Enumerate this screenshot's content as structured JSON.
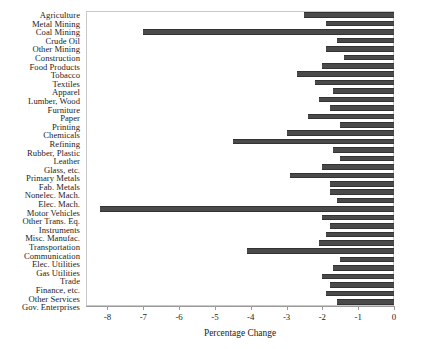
{
  "chart_data": {
    "type": "bar",
    "orientation": "horizontal",
    "title": "",
    "xlabel": "Percentage Change",
    "ylabel": "",
    "xlim": [
      -8.6,
      0
    ],
    "ylim": null,
    "grid": false,
    "legend": null,
    "bar_color": "#4a4a4a",
    "frame_color": "#c9c9c9",
    "axis_ticks": [
      "-8",
      "-7",
      "-6",
      "-5",
      "-4",
      "-3",
      "-2",
      "-1",
      "0"
    ],
    "axis_tick_values": [
      -8,
      -7,
      -6,
      -5,
      -4,
      -3,
      -2,
      -1,
      0
    ],
    "categories": [
      "Agriculture",
      "Metal Mining",
      "Coal Mining",
      "Crude Oil",
      "Other Mining",
      "Construction",
      "Food Products",
      "Tobacco",
      "Textiles",
      "Apparel",
      "Lumber, Wood",
      "Furniture",
      "Paper",
      "Printing",
      "Chemicals",
      "Refining",
      "Rubber, Plastic",
      "Leather",
      "Glass, etc.",
      "Primary Metals",
      "Fab. Metals",
      "Nonelec. Mach.",
      "Elec. Mach.",
      "Motor Vehicles",
      "Other Trans. Eq.",
      "Instruments",
      "Misc. Manufac.",
      "Transportation",
      "Communication",
      "Elec. Utilities",
      "Gas Utilities",
      "Trade",
      "Finance, etc.",
      "Other Services",
      "Gov. Enterprises"
    ],
    "values": [
      -2.5,
      -1.9,
      -7.0,
      -1.6,
      -1.9,
      -1.4,
      -2.0,
      -2.7,
      -2.2,
      -1.7,
      -2.1,
      -1.8,
      -2.4,
      -1.5,
      -3.0,
      -4.5,
      -1.7,
      -1.5,
      -2.0,
      -2.9,
      -1.8,
      -1.8,
      -1.6,
      -8.2,
      -2.0,
      -1.8,
      -1.9,
      -2.1,
      -4.1,
      -1.5,
      -1.7,
      -2.0,
      -1.8,
      -1.9,
      -1.6
    ]
  }
}
